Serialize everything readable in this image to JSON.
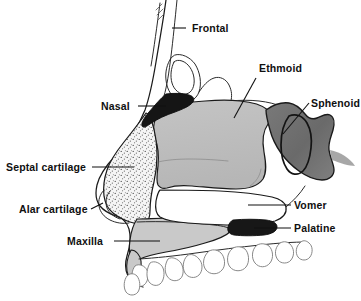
{
  "figure": {
    "background_color": "#ffffff",
    "line_color": "#1a1a1a"
  },
  "palette": {
    "nasal_bone": "#1b1b1b",
    "ethmoid": "#bdbdbd",
    "sphenoid": "#6f6f6f",
    "septal_cartilage": "#f4f4f4",
    "septal_cartilage_stipple": "#4a4a4a",
    "maxilla": "#c9c9c9",
    "vomer": "#ffffff",
    "palatine": "#1b1b1b",
    "teeth": "#ffffff",
    "skin_outline": "#2b2b2b"
  },
  "labels": [
    {
      "id": "frontal",
      "text": "Frontal",
      "x": 192,
      "y": 32,
      "anchor": "start",
      "leader": "M 186 28 L 172 28",
      "structure": "frontal-bone"
    },
    {
      "id": "nasal",
      "text": "Nasal",
      "x": 101,
      "y": 110,
      "anchor": "start",
      "leader": "M 138 106 L 166 106",
      "structure": "nasal-bone"
    },
    {
      "id": "ethmoid",
      "text": "Ethmoid",
      "x": 259,
      "y": 72,
      "anchor": "start",
      "leader": "M 256 78 L 234 118",
      "structure": "ethmoid-bone"
    },
    {
      "id": "sphenoid",
      "text": "Sphenoid",
      "x": 311,
      "y": 107,
      "anchor": "start",
      "leader": "M 309 103 L 283 134",
      "structure": "sphenoid-bone"
    },
    {
      "id": "septal-cartilage",
      "text": "Septal cartilage",
      "x": 6,
      "y": 171,
      "anchor": "start",
      "leader": "M 92 167 L 134 167",
      "structure": "septal-cartilage"
    },
    {
      "id": "alar-cartilage",
      "text": "Alar cartilage",
      "x": 19,
      "y": 213,
      "anchor": "start",
      "leader": "M 91 209 L 103 203",
      "structure": "alar-cartilage"
    },
    {
      "id": "maxilla",
      "text": "Maxilla",
      "x": 67,
      "y": 245,
      "anchor": "start",
      "leader": "M 114 241 L 160 241",
      "structure": "maxilla-bone"
    },
    {
      "id": "vomer",
      "text": "Vomer",
      "x": 294,
      "y": 209,
      "anchor": "start",
      "leader": "M 291 205 L 248 205",
      "structure": "vomer-bone"
    },
    {
      "id": "palatine",
      "text": "Palatine",
      "x": 294,
      "y": 232,
      "anchor": "start",
      "leader": "M 291 228 L 254 228",
      "structure": "palatine-bone"
    }
  ]
}
